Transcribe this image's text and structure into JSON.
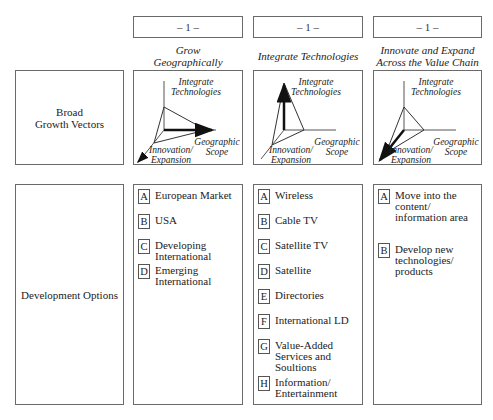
{
  "columns": [
    {
      "number": "– 1 –",
      "title": "Grow\nGeographically",
      "diagram": {
        "emphasis": "geographic-scope",
        "axes": {
          "vertical": "Integrate\nTechnologies",
          "horizontal": "Geographic\nScope",
          "diagonal": "Innovation/\nExpansion"
        }
      },
      "options": [
        {
          "letter": "A",
          "text": "European Market"
        },
        {
          "letter": "B",
          "text": "USA"
        },
        {
          "letter": "C",
          "text": "Developing\nInternational"
        },
        {
          "letter": "D",
          "text": "Emerging\nInternational"
        }
      ]
    },
    {
      "number": "– 1 –",
      "title": "Integrate Technologies",
      "diagram": {
        "emphasis": "integrate-technologies",
        "axes": {
          "vertical": "Integrate\nTechnologies",
          "horizontal": "Geographic\nScope",
          "diagonal": "Innovation/\nExpansion"
        }
      },
      "options": [
        {
          "letter": "A",
          "text": "Wireless"
        },
        {
          "letter": "B",
          "text": "Cable TV"
        },
        {
          "letter": "C",
          "text": "Satellite TV"
        },
        {
          "letter": "D",
          "text": "Satellite"
        },
        {
          "letter": "E",
          "text": "Directories"
        },
        {
          "letter": "F",
          "text": "International LD"
        },
        {
          "letter": "G",
          "text": "Value-Added\nServices and\nSoultions"
        },
        {
          "letter": "H",
          "text": "Information/\nEntertainment"
        }
      ]
    },
    {
      "number": "– 1 –",
      "title": "Innovate and Expand\nAcross the Value Chain",
      "diagram": {
        "emphasis": "innovation-expansion",
        "axes": {
          "vertical": "Integrate\nTechnologies",
          "horizontal": "Geographic\nScope",
          "diagonal": "Innovation/\nExpansion"
        }
      },
      "options": [
        {
          "letter": "A",
          "text": "Move into the\ncontent/\ninformation area"
        },
        {
          "letter": "B",
          "text": "Develop new\ntechnologies/\nproducts"
        }
      ]
    }
  ],
  "rows": {
    "vectors_label": "Broad\nGrowth Vectors",
    "options_label": "Development Options"
  }
}
